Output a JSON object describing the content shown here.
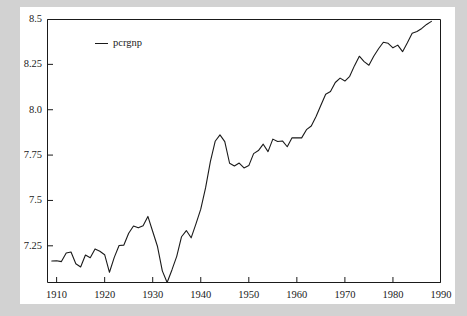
{
  "chart_data": {
    "type": "line",
    "title": "",
    "subtitle": "",
    "xlabel": "",
    "ylabel": "",
    "grid": false,
    "legend_position": "top-left",
    "xlim": [
      1908,
      1990
    ],
    "ylim": [
      7.045,
      8.5
    ],
    "xticks": [
      1910,
      1920,
      1930,
      1940,
      1950,
      1960,
      1970,
      1980,
      1990
    ],
    "xtick_labels": [
      "1910",
      "1920",
      "1930",
      "1940",
      "1950",
      "1960",
      "1970",
      "1980",
      "1990"
    ],
    "yticks": [
      7.25,
      7.5,
      7.75,
      8.0,
      8.25,
      8.5
    ],
    "ytick_labels": [
      "7.25",
      "7.5",
      "7.75",
      "8.0",
      "8.25",
      "8.5"
    ],
    "series": [
      {
        "name": "pcrgnp",
        "color": "#1a1a1a",
        "x": [
          1909,
          1910,
          1911,
          1912,
          1913,
          1914,
          1915,
          1916,
          1917,
          1918,
          1919,
          1920,
          1921,
          1922,
          1923,
          1924,
          1925,
          1926,
          1927,
          1928,
          1929,
          1930,
          1931,
          1932,
          1933,
          1934,
          1935,
          1936,
          1937,
          1938,
          1939,
          1940,
          1941,
          1942,
          1943,
          1944,
          1945,
          1946,
          1947,
          1948,
          1949,
          1950,
          1951,
          1952,
          1953,
          1954,
          1955,
          1956,
          1957,
          1958,
          1959,
          1960,
          1961,
          1962,
          1963,
          1964,
          1965,
          1966,
          1967,
          1968,
          1969,
          1970,
          1971,
          1972,
          1973,
          1974,
          1975,
          1976,
          1977,
          1978,
          1979,
          1980,
          1981,
          1982,
          1983,
          1984,
          1985,
          1986,
          1987,
          1988
        ],
        "y": [
          7.166,
          7.168,
          7.163,
          7.21,
          7.216,
          7.151,
          7.133,
          7.199,
          7.184,
          7.233,
          7.22,
          7.201,
          7.104,
          7.186,
          7.252,
          7.254,
          7.319,
          7.359,
          7.349,
          7.361,
          7.412,
          7.329,
          7.246,
          7.112,
          7.048,
          7.117,
          7.192,
          7.3,
          7.334,
          7.294,
          7.371,
          7.452,
          7.569,
          7.714,
          7.826,
          7.861,
          7.824,
          7.705,
          7.69,
          7.706,
          7.679,
          7.692,
          7.758,
          7.775,
          7.81,
          7.769,
          7.838,
          7.825,
          7.828,
          7.796,
          7.845,
          7.845,
          7.845,
          7.89,
          7.91,
          7.963,
          8.025,
          8.085,
          8.1,
          8.15,
          8.174,
          8.158,
          8.184,
          8.243,
          8.295,
          8.265,
          8.245,
          8.295,
          8.336,
          8.372,
          8.366,
          8.341,
          8.356,
          8.32,
          8.369,
          8.421,
          8.431,
          8.448,
          8.47,
          8.487
        ]
      }
    ]
  },
  "legend": {
    "entries": [
      {
        "label": "pcrgnp",
        "marker": "line-swatch"
      }
    ]
  },
  "colors": {
    "figure_background": "#ffffff",
    "page_background": "#d2d2d2",
    "axis": "#1a1a1a",
    "series_line": "#1a1a1a"
  }
}
